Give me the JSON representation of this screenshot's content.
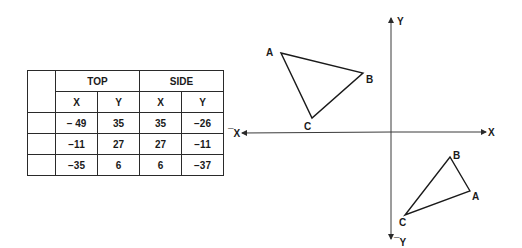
{
  "table": {
    "groups": [
      "TOP",
      "SIDE"
    ],
    "columns": [
      "X",
      "Y",
      "X",
      "Y"
    ],
    "rows": [
      [
        "− 49",
        "35",
        "35",
        "−26"
      ],
      [
        "−11",
        "27",
        "27",
        "−11"
      ],
      [
        "−35",
        "6",
        "6",
        "−37"
      ]
    ]
  },
  "axes": {
    "x_pos_label": "X",
    "x_neg_label": "¯X",
    "y_pos_label": "Y",
    "y_neg_label": "¯Y"
  },
  "triangles": [
    {
      "name": "top-left",
      "vertices": [
        {
          "label": "A",
          "x": 281,
          "y": 53
        },
        {
          "label": "B",
          "x": 363,
          "y": 73
        },
        {
          "label": "C",
          "x": 312,
          "y": 118
        }
      ]
    },
    {
      "name": "bottom-right",
      "vertices": [
        {
          "label": "A",
          "x": 470,
          "y": 191
        },
        {
          "label": "B",
          "x": 450,
          "y": 157
        },
        {
          "label": "C",
          "x": 405,
          "y": 215
        }
      ]
    }
  ]
}
